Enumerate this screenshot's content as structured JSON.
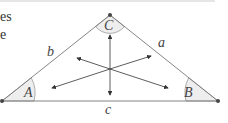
{
  "clipped_text": {
    "line1": "es",
    "line2": "e"
  },
  "triangle": {
    "vertices": {
      "A": {
        "x": 2,
        "y": 101
      },
      "B": {
        "x": 218,
        "y": 101
      },
      "C": {
        "x": 110,
        "y": 15
      }
    },
    "angle_labels": {
      "A": "A",
      "B": "B",
      "C": "C"
    },
    "side_labels": {
      "a": "a",
      "b": "b",
      "c": "c"
    },
    "center": {
      "x": 110,
      "y": 69
    }
  },
  "colors": {
    "line": "#777777",
    "angle_fill": "#eeeeee",
    "vertex_dot": "#444444",
    "text": "#444444"
  }
}
